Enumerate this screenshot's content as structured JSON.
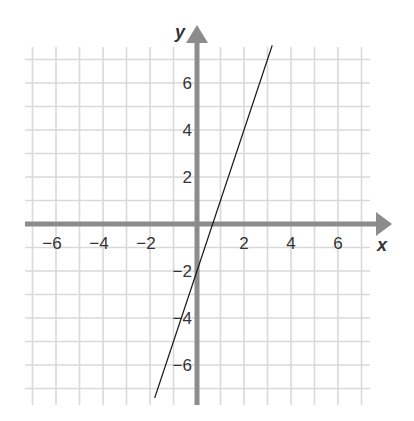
{
  "chart_data": {
    "type": "line",
    "title": "",
    "xlabel": "x",
    "ylabel": "y",
    "xlim": [
      -7.5,
      7.5
    ],
    "ylim": [
      -7.5,
      7.5
    ],
    "grid": true,
    "x_ticks": [
      -6,
      -4,
      -2,
      2,
      4,
      6
    ],
    "y_ticks": [
      6,
      4,
      2,
      -2,
      -4,
      -6
    ],
    "x_tick_labels": [
      "−6",
      "−4",
      "−2",
      "2",
      "4",
      "6"
    ],
    "y_tick_labels": [
      "6",
      "4",
      "2",
      "−2",
      "−4",
      "−6"
    ],
    "series": [
      {
        "name": "line",
        "equation": "y = 3x - 2",
        "slope": 3,
        "intercept": -2,
        "x": [
          -1.8,
          3.2
        ],
        "y": [
          -7.4,
          7.6
        ]
      }
    ]
  },
  "colors": {
    "axis": "#8c8c8c",
    "grid": "#d9d9d9",
    "line": "#1a1a1a",
    "text": "#333333"
  }
}
